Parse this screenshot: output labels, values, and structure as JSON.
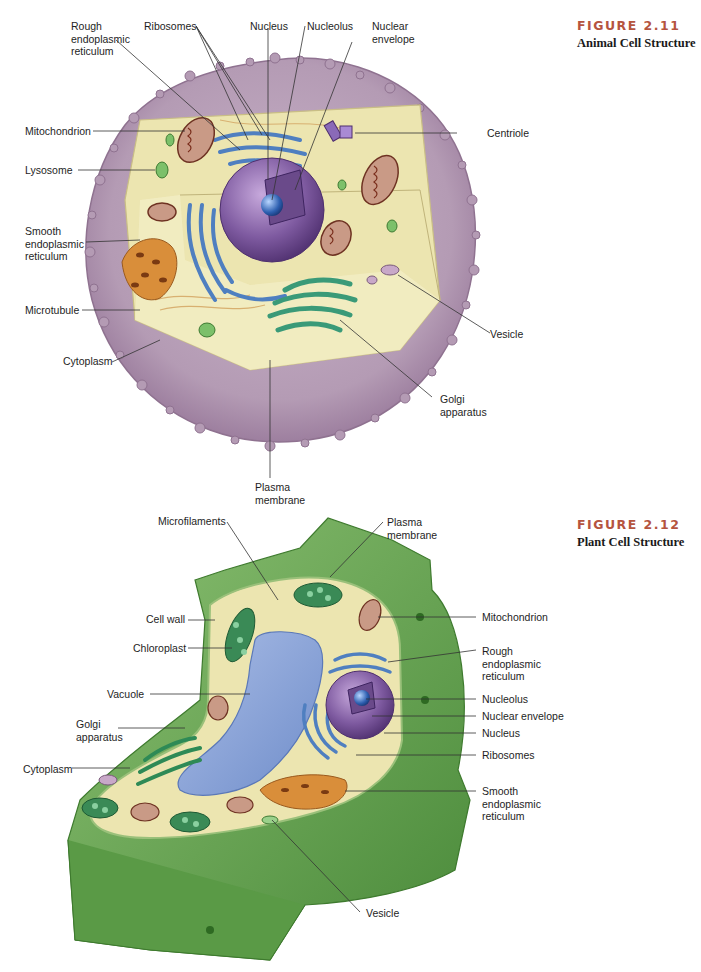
{
  "figures": [
    {
      "number": "FIGURE 2.11",
      "title": "Animal Cell Structure",
      "labels": {
        "rough_er": "Rough\nendoplasmic\nreticulum",
        "ribosomes": "Ribosomes",
        "nucleus": "Nucleus",
        "nucleolus": "Nucleolus",
        "nuclear_envelope": "Nuclear\nenvelope",
        "mitochondrion": "Mitochondrion",
        "centriole": "Centriole",
        "lysosome": "Lysosome",
        "smooth_er": "Smooth\nendoplasmic\nreticulum",
        "microtubule": "Microtubule",
        "cytoplasm": "Cytoplasm",
        "vesicle": "Vesicle",
        "golgi": "Golgi\napparatus",
        "plasma_membrane": "Plasma\nmembrane"
      }
    },
    {
      "number": "FIGURE 2.12",
      "title": "Plant Cell Structure",
      "labels": {
        "microfilaments": "Microfilaments",
        "plasma_membrane": "Plasma\nmembrane",
        "cell_wall": "Cell wall",
        "chloroplast": "Chloroplast",
        "vacuole": "Vacuole",
        "golgi": "Golgi\napparatus",
        "cytoplasm": "Cytoplasm",
        "mitochondrion": "Mitochondrion",
        "rough_er": "Rough\nendoplasmic\nreticulum",
        "nucleolus": "Nucleolus",
        "nuclear_envelope": "Nuclear envelope",
        "nucleus": "Nucleus",
        "ribosomes": "Ribosomes",
        "smooth_er": "Smooth\nendoplasmic\nreticulum",
        "vesicle": "Vesicle"
      }
    }
  ],
  "colors": {
    "figure_number": "#b5543f",
    "animal_membrane": "#b49bb4",
    "cytoplasm": "#ece5b0",
    "nucleus": "#7e5aa0",
    "rough_er": "#4f7fc0",
    "golgi": "#3a9a78",
    "smooth_er": "#d98e3a",
    "mitochondrion": "#8a4a3a",
    "cell_wall": "#5e9a4a",
    "vacuole": "#8aa4d8",
    "chloroplast": "#2f7a4a"
  }
}
